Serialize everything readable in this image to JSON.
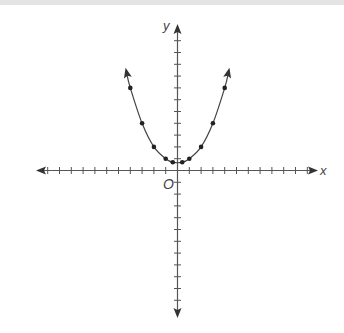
{
  "chart_data": {
    "type": "scatter",
    "title": "",
    "xlabel": "x",
    "ylabel": "y",
    "origin_label": "O",
    "x": [
      -4,
      -3,
      -2,
      -1,
      -0.4,
      0.4,
      1,
      2,
      3,
      4
    ],
    "y": [
      7,
      4,
      2,
      1,
      0.7,
      0.7,
      1,
      2,
      4,
      7
    ],
    "series": [
      {
        "name": "points",
        "x": [
          -4,
          -3,
          -2,
          -1,
          -0.4,
          0.4,
          1,
          2,
          3,
          4
        ],
        "y": [
          7,
          4,
          2,
          1,
          0.7,
          0.7,
          1,
          2,
          4,
          7
        ],
        "connected_by_smooth_curve": true,
        "arrows_at_ends": true
      }
    ],
    "xlim": [
      -12,
      12
    ],
    "ylim": [
      -12,
      12
    ],
    "x_ticks_each_side": 11,
    "y_ticks_each_side": 11,
    "tick_labels": false,
    "grid": false,
    "legend": null
  },
  "style": {
    "axis_color": "#555555",
    "curve_color": "#444444",
    "point_color": "#222222",
    "top_strip_color": "#e4e4e4"
  }
}
